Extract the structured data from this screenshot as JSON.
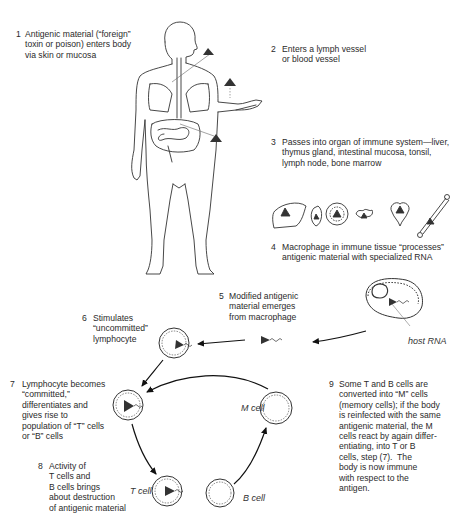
{
  "figure": {
    "type": "immune-response-flow-diagram",
    "steps": [
      {
        "number": "1",
        "lines": [
          "Antigenic material (“foreign”",
          "toxin or poison) enters body",
          "via skin or mucosa"
        ]
      },
      {
        "number": "2",
        "lines": [
          "Enters a lymph vessel",
          "or blood vessel"
        ]
      },
      {
        "number": "3",
        "lines": [
          "Passes into organ of immune system—liver,",
          "thymus gland, intestinal mucosa, tonsil,",
          "lymph node, bone marrow"
        ]
      },
      {
        "number": "4",
        "lines": [
          "Macrophage in immune tissue “processes”",
          "antigenic material with specialized RNA"
        ]
      },
      {
        "number": "5",
        "lines": [
          "Modified antigenic",
          "material emerges",
          "from macrophage"
        ]
      },
      {
        "number": "6",
        "lines": [
          "Stimulates",
          "“uncommitted”",
          "lymphocyte"
        ]
      },
      {
        "number": "7",
        "lines": [
          "Lymphocyte becomes",
          "“committed,”",
          "differentiates and",
          "gives rise to",
          "population of “T” cells",
          "or “B” cells"
        ]
      },
      {
        "number": "8",
        "lines": [
          "Activity of",
          "T cells and",
          "B cells brings",
          "about destruction",
          "of antigenic material"
        ]
      },
      {
        "number": "9",
        "lines": [
          "Some T and B cells are",
          "converted into “M” cells",
          "(memory cells); if the body",
          "is reinfected with the same",
          "antigenic material, the M",
          "cells react by again differ-",
          "entiating, into T or B",
          "cells, step (7).  The",
          "body is now immune",
          "with respect to the",
          "antigen."
        ]
      }
    ],
    "labels": {
      "host_rna": "host RNA",
      "m_cell": "M cell",
      "t_cell": "T cell",
      "b_cell": "B cell"
    },
    "icons": {
      "antigen": "filled-triangle",
      "organs": [
        "liver-icon",
        "thymus-icon",
        "intestinal-mucosa-icon",
        "tonsil-icon",
        "lymph-node-icon",
        "bone-marrow-icon"
      ]
    },
    "colors": {
      "ink": "#222222",
      "background": "#ffffff"
    }
  }
}
